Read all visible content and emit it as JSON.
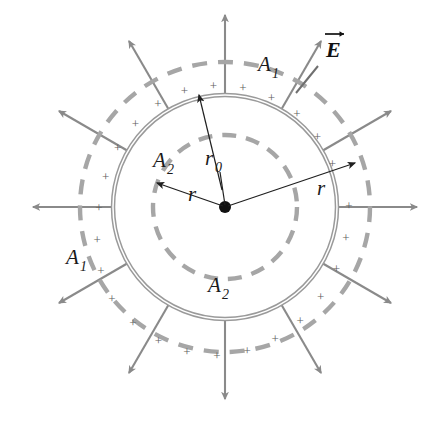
{
  "figure": {
    "type": "physics-diagram",
    "background_color": "#ffffff",
    "colors": {
      "field_line": "#8a8a8a",
      "gaussian_surface": "#a6a6a6",
      "shell": "#9a9a9a",
      "label_text": "#1a1a1a",
      "plus_sign": "#5d5d5d",
      "center_dot": "#111111",
      "dimension_arrow": "#2a2a2a"
    },
    "geometry": {
      "center": {
        "x": 225,
        "y": 207
      },
      "shell_radius": 112,
      "inner_gaussian_radius": 72,
      "outer_gaussian_radius": 145,
      "field_line_outer_extent": 192,
      "field_line_count": 12,
      "field_line_angle_step_deg": 30,
      "plus_sign_count": 24,
      "plus_sign_radius": 124
    },
    "labels": {
      "outer_surface_top": {
        "text": "A",
        "sub": "1",
        "x": 267,
        "y": 62
      },
      "outer_surface_left": {
        "text": "A",
        "sub": "1",
        "x": 73,
        "y": 262
      },
      "inner_surface_upper_left": {
        "text": "A",
        "sub": "2",
        "x": 160,
        "y": 162
      },
      "inner_surface_bottom": {
        "text": "A",
        "sub": "2",
        "x": 214,
        "y": 288
      },
      "shell_radius_label": {
        "text": "r",
        "sub": "0",
        "x": 209,
        "y": 160
      },
      "radius_inner_label": {
        "text": "r",
        "sub": "",
        "x": 143,
        "y": 196
      },
      "radius_outer_label": {
        "text": "r",
        "sub": "",
        "x": 320,
        "y": 191
      },
      "field_vector_label": {
        "text": "E",
        "x": 328,
        "y": 48
      }
    },
    "plus_symbol": "+",
    "annotations": {
      "shell_radius_arrow": {
        "from": [
          225,
          207
        ],
        "to": [
          199,
          95
        ],
        "label": "r0"
      },
      "inner_radius_arrow": {
        "from": [
          225,
          207
        ],
        "to": [
          155,
          183
        ],
        "label": "r"
      },
      "outer_radius_arrow": {
        "from": [
          225,
          207
        ],
        "to": [
          355,
          163
        ],
        "label": "r"
      },
      "field_vector_pointer": {
        "from": [
          322,
          62
        ],
        "to": [
          293,
          98
        ],
        "label": "E"
      }
    }
  }
}
